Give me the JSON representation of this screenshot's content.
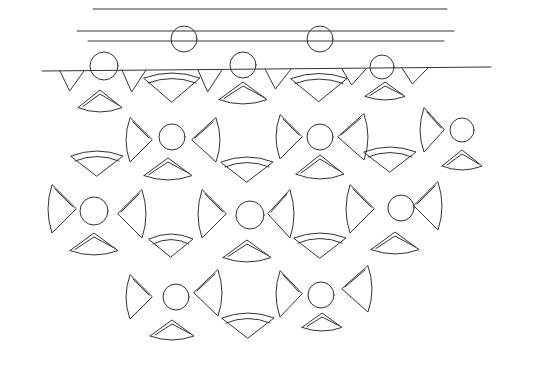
{
  "diagram": {
    "title": "",
    "stroke_color": "#333333",
    "background": "#ffffff",
    "lines": [
      {
        "x1": 93,
        "y1": 9,
        "x2": 447,
        "y2": 9
      },
      {
        "x1": 77,
        "y1": 31,
        "x2": 454,
        "y2": 31
      },
      {
        "x1": 88,
        "y1": 41,
        "x2": 444,
        "y2": 41
      },
      {
        "x1": 42,
        "y1": 71,
        "x2": 491,
        "y2": 67
      }
    ],
    "circles": [
      {
        "cx": 184,
        "cy": 39,
        "r": 13
      },
      {
        "cx": 320,
        "cy": 39,
        "r": 13
      },
      {
        "cx": 104,
        "cy": 66,
        "r": 14
      },
      {
        "cx": 243,
        "cy": 65,
        "r": 13
      },
      {
        "cx": 382,
        "cy": 67,
        "r": 12
      },
      {
        "cx": 172,
        "cy": 137,
        "r": 13
      },
      {
        "cx": 320,
        "cy": 137,
        "r": 13
      },
      {
        "cx": 462,
        "cy": 130,
        "r": 12
      },
      {
        "cx": 94,
        "cy": 211,
        "r": 14
      },
      {
        "cx": 250,
        "cy": 215,
        "r": 14
      },
      {
        "cx": 401,
        "cy": 208,
        "r": 13
      },
      {
        "cx": 176,
        "cy": 297,
        "r": 13
      },
      {
        "cx": 321,
        "cy": 295,
        "r": 13
      }
    ],
    "fans_up": [
      {
        "x": 100,
        "y": 90,
        "w": 22,
        "h": 22
      },
      {
        "x": 243,
        "y": 82,
        "w": 24,
        "h": 22
      },
      {
        "x": 385,
        "y": 82,
        "w": 20,
        "h": 18
      },
      {
        "x": 168,
        "y": 158,
        "w": 24,
        "h": 22
      },
      {
        "x": 320,
        "y": 155,
        "w": 24,
        "h": 24
      },
      {
        "x": 462,
        "y": 150,
        "w": 20,
        "h": 20
      },
      {
        "x": 94,
        "y": 233,
        "w": 24,
        "h": 22
      },
      {
        "x": 247,
        "y": 240,
        "w": 24,
        "h": 22
      },
      {
        "x": 395,
        "y": 232,
        "w": 24,
        "h": 22
      },
      {
        "x": 172,
        "y": 320,
        "w": 22,
        "h": 20
      },
      {
        "x": 322,
        "y": 313,
        "w": 20,
        "h": 18
      }
    ],
    "fans_down": [
      {
        "x": 172,
        "y": 88,
        "w": 28,
        "h": 28
      },
      {
        "x": 319,
        "y": 88,
        "w": 28,
        "h": 27
      },
      {
        "x": 97,
        "y": 164,
        "w": 26,
        "h": 24
      },
      {
        "x": 247,
        "y": 170,
        "w": 26,
        "h": 24
      },
      {
        "x": 390,
        "y": 160,
        "w": 26,
        "h": 24
      },
      {
        "x": 171,
        "y": 246,
        "w": 22,
        "h": 22
      },
      {
        "x": 320,
        "y": 246,
        "w": 26,
        "h": 24
      },
      {
        "x": 248,
        "y": 326,
        "w": 26,
        "h": 24
      }
    ],
    "petals_left": [
      {
        "x": 130,
        "y": 118,
        "w": 22,
        "h": 44
      },
      {
        "x": 280,
        "y": 115,
        "w": 22,
        "h": 44
      },
      {
        "x": 424,
        "y": 108,
        "w": 20,
        "h": 44
      },
      {
        "x": 52,
        "y": 185,
        "w": 24,
        "h": 48
      },
      {
        "x": 202,
        "y": 190,
        "w": 24,
        "h": 48
      },
      {
        "x": 350,
        "y": 185,
        "w": 24,
        "h": 48
      },
      {
        "x": 130,
        "y": 275,
        "w": 22,
        "h": 44
      },
      {
        "x": 280,
        "y": 271,
        "w": 22,
        "h": 46
      }
    ],
    "petals_right": [
      {
        "x": 192,
        "y": 118,
        "w": 24,
        "h": 44
      },
      {
        "x": 338,
        "y": 114,
        "w": 26,
        "h": 46
      },
      {
        "x": 118,
        "y": 190,
        "w": 24,
        "h": 48
      },
      {
        "x": 268,
        "y": 190,
        "w": 22,
        "h": 48
      },
      {
        "x": 414,
        "y": 182,
        "w": 24,
        "h": 48
      },
      {
        "x": 194,
        "y": 270,
        "w": 24,
        "h": 46
      },
      {
        "x": 342,
        "y": 266,
        "w": 26,
        "h": 46
      }
    ],
    "top_notches": [
      {
        "x": 60,
        "y": 71,
        "w": 24,
        "h": 20
      },
      {
        "x": 122,
        "y": 70,
        "w": 24,
        "h": 22
      },
      {
        "x": 198,
        "y": 70,
        "w": 24,
        "h": 22
      },
      {
        "x": 265,
        "y": 69,
        "w": 26,
        "h": 20
      },
      {
        "x": 342,
        "y": 69,
        "w": 24,
        "h": 16
      },
      {
        "x": 402,
        "y": 68,
        "w": 26,
        "h": 16
      }
    ]
  }
}
